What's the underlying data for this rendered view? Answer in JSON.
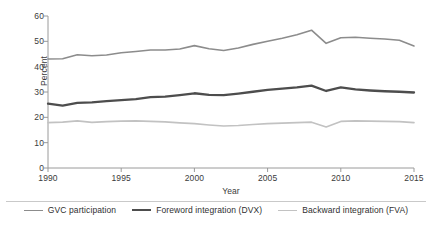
{
  "chart_data": {
    "type": "line",
    "title": "",
    "xlabel": "Year",
    "ylabel": "Percent",
    "xlim": [
      1990,
      2015
    ],
    "ylim": [
      0,
      60
    ],
    "yticks": [
      0,
      10,
      20,
      30,
      40,
      50,
      60
    ],
    "xticks": [
      1990,
      1995,
      2000,
      2005,
      2010,
      2015
    ],
    "grid": false,
    "legend_position": "bottom",
    "x": [
      1990,
      1991,
      1992,
      1993,
      1994,
      1995,
      1996,
      1997,
      1998,
      1999,
      2000,
      2001,
      2002,
      2003,
      2004,
      2005,
      2006,
      2007,
      2008,
      2009,
      2010,
      2011,
      2012,
      2013,
      2014,
      2015
    ],
    "series": [
      {
        "name": "GVC participation",
        "color": "#8c8c8c",
        "width": 1.6,
        "values": [
          43.0,
          43.1,
          44.7,
          44.3,
          44.6,
          45.5,
          46.0,
          46.6,
          46.6,
          47.0,
          48.3,
          47.1,
          46.4,
          47.4,
          48.8,
          50.0,
          51.2,
          52.6,
          54.4,
          49.2,
          51.4,
          51.6,
          51.2,
          50.9,
          50.4,
          48.2
        ]
      },
      {
        "name": "Foreword integration (DVX)",
        "color": "#4d4d4d",
        "width": 2.3,
        "values": [
          25.4,
          24.6,
          25.7,
          25.9,
          26.4,
          26.8,
          27.2,
          28.0,
          28.2,
          28.8,
          29.5,
          28.9,
          28.8,
          29.4,
          30.1,
          30.8,
          31.3,
          31.8,
          32.5,
          30.4,
          31.8,
          31.0,
          30.6,
          30.3,
          30.1,
          29.8
        ]
      },
      {
        "name": "Backward integration (FVA)",
        "color": "#c2c2c2",
        "width": 1.6,
        "values": [
          17.9,
          18.1,
          18.6,
          18.0,
          18.3,
          18.5,
          18.6,
          18.4,
          18.2,
          17.8,
          17.5,
          17.0,
          16.6,
          16.8,
          17.2,
          17.5,
          17.7,
          17.9,
          18.1,
          16.2,
          18.4,
          18.6,
          18.5,
          18.4,
          18.3,
          17.9
        ]
      }
    ]
  },
  "legend": [
    {
      "label": "GVC participation",
      "color": "#8c8c8c",
      "width": "1.6px"
    },
    {
      "label": "Foreword integration (DVX)",
      "color": "#4d4d4d",
      "width": "2.3px"
    },
    {
      "label": "Backward integration (FVA)",
      "color": "#c2c2c2",
      "width": "1.6px"
    }
  ],
  "axis": {
    "color": "#9a9a9a"
  }
}
